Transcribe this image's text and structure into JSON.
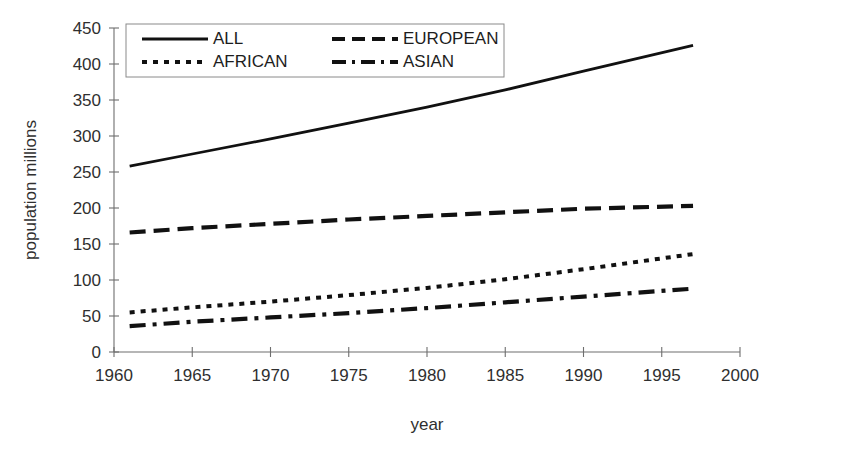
{
  "chart_data": {
    "type": "line",
    "title": "",
    "xlabel": "year",
    "ylabel": "population  millions",
    "xlim": [
      1960,
      2000
    ],
    "ylim": [
      0,
      450
    ],
    "grid": false,
    "legend_position": "top-left-inside",
    "x_ticks": [
      "1960",
      "1965",
      "1970",
      "1975",
      "1980",
      "1985",
      "1990",
      "1995",
      "2000"
    ],
    "y_ticks": [
      "0",
      "50",
      "100",
      "150",
      "200",
      "250",
      "300",
      "350",
      "400",
      "450"
    ],
    "x": [
      1961,
      1965,
      1970,
      1975,
      1980,
      1985,
      1990,
      1997
    ],
    "series": [
      {
        "name": "ALL",
        "style": "solid",
        "color": "#111111",
        "values": [
          258,
          275,
          296,
          318,
          340,
          364,
          390,
          426
        ]
      },
      {
        "name": "EUROPEAN",
        "style": "dashed",
        "color": "#111111",
        "values": [
          166,
          172,
          178,
          184,
          189,
          194,
          199,
          203
        ]
      },
      {
        "name": "AFRICAN",
        "style": "dotted",
        "color": "#111111",
        "values": [
          55,
          62,
          70,
          79,
          89,
          101,
          115,
          136
        ]
      },
      {
        "name": "ASIAN",
        "style": "dashdot",
        "color": "#111111",
        "values": [
          36,
          42,
          48,
          54,
          61,
          69,
          77,
          88
        ]
      }
    ],
    "legend_entries": [
      {
        "label": "ALL",
        "style": "solid"
      },
      {
        "label": "EUROPEAN",
        "style": "dashed"
      },
      {
        "label": "AFRICAN",
        "style": "dotted"
      },
      {
        "label": "ASIAN",
        "style": "dashdot"
      }
    ]
  },
  "axes": {
    "x_title": "year",
    "y_title": "population  millions"
  },
  "legend": {
    "all_label": "ALL",
    "european_label": "EUROPEAN",
    "african_label": "AFRICAN",
    "asian_label": "ASIAN"
  },
  "yticks": {
    "t0": "0",
    "t1": "50",
    "t2": "100",
    "t3": "150",
    "t4": "200",
    "t5": "250",
    "t6": "300",
    "t7": "350",
    "t8": "400",
    "t9": "450"
  },
  "xticks": {
    "t0": "1960",
    "t1": "1965",
    "t2": "1970",
    "t3": "1975",
    "t4": "1980",
    "t5": "1985",
    "t6": "1990",
    "t7": "1995",
    "t8": "2000"
  }
}
